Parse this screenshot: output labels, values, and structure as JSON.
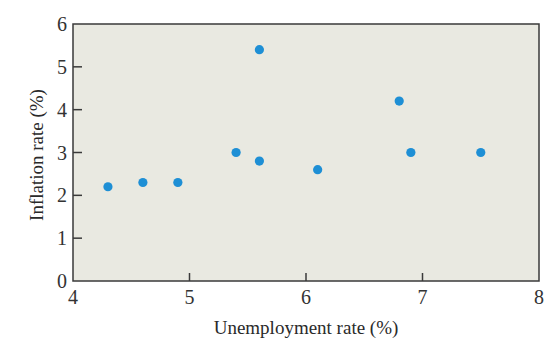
{
  "chart_data": {
    "type": "scatter",
    "title": "",
    "xlabel": "Unemployment rate (%)",
    "ylabel": "Inflation rate (%)",
    "xlim": [
      4,
      8
    ],
    "ylim": [
      0,
      6
    ],
    "xticks": [
      4,
      5,
      6,
      7,
      8
    ],
    "yticks": [
      0,
      1,
      2,
      3,
      4,
      5,
      6
    ],
    "grid": false,
    "legend": null,
    "series": [
      {
        "name": "observations",
        "color": "#1e8fd5",
        "points": [
          {
            "x": 4.3,
            "y": 2.2
          },
          {
            "x": 4.6,
            "y": 2.3
          },
          {
            "x": 4.9,
            "y": 2.3
          },
          {
            "x": 5.4,
            "y": 3.0
          },
          {
            "x": 5.6,
            "y": 5.4
          },
          {
            "x": 5.6,
            "y": 2.8
          },
          {
            "x": 6.1,
            "y": 2.6
          },
          {
            "x": 6.8,
            "y": 4.2
          },
          {
            "x": 6.9,
            "y": 3.0
          },
          {
            "x": 7.5,
            "y": 3.0
          }
        ]
      }
    ]
  },
  "style": {
    "plot_background": "#e9e9e1",
    "axis_color": "#3a3a3a",
    "point_color": "#1e8fd5"
  }
}
